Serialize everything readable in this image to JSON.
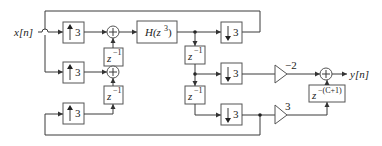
{
  "diagram": {
    "input_label": "x[n]",
    "output_label": "y[n]",
    "upsamplers": [
      {
        "factor": "3"
      },
      {
        "factor": "3"
      },
      {
        "factor": "3"
      }
    ],
    "adders_symbol": "+",
    "delays_left": [
      {
        "base": "z",
        "exp": "−1"
      },
      {
        "base": "z",
        "exp": "−1"
      }
    ],
    "filter": {
      "label": "H(z",
      "exp": "3",
      "close": ")"
    },
    "delays_right": [
      {
        "base": "z",
        "exp": "−1"
      },
      {
        "base": "z",
        "exp": "−1"
      }
    ],
    "downsamplers": [
      {
        "factor": "3"
      },
      {
        "factor": "3"
      },
      {
        "factor": "3"
      }
    ],
    "gains": [
      {
        "value": "−2"
      },
      {
        "value": "3"
      }
    ],
    "output_delay": {
      "base": "z",
      "exp": "−(C+1)"
    },
    "colors": {
      "line": "#3a3a3a",
      "box": "#555555",
      "text": "#222222"
    }
  }
}
